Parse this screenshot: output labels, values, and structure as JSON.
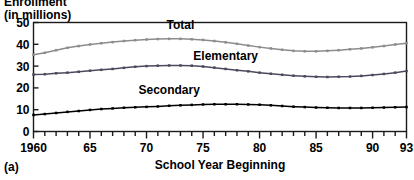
{
  "figure": {
    "panel_tag": "(a)",
    "y_axis_label_line1": "Enrollment",
    "y_axis_label_line2": "(in millions)",
    "x_axis_title": "School Year Beginning"
  },
  "chart_data": {
    "type": "line",
    "title": "",
    "subtitle": "",
    "xlabel": "School Year Beginning",
    "ylabel": "Enrollment (in millions)",
    "xlim": [
      1960,
      1993
    ],
    "ylim": [
      0,
      50
    ],
    "grid": false,
    "legend_position": "inline-labels",
    "y_ticks": [
      0,
      10,
      20,
      30,
      40,
      50
    ],
    "y_tick_labels": [
      "0",
      "10",
      "20",
      "30",
      "40",
      "50"
    ],
    "x_ticks": [
      1960,
      1965,
      1970,
      1975,
      1980,
      1985,
      1990,
      1993
    ],
    "x_tick_labels": [
      "1960",
      "65",
      "70",
      "75",
      "80",
      "85",
      "90",
      "93"
    ],
    "x_minor_tick_interval": 1,
    "markers": "small-square",
    "x": [
      1960,
      1961,
      1962,
      1963,
      1964,
      1965,
      1966,
      1967,
      1968,
      1969,
      1970,
      1971,
      1972,
      1973,
      1974,
      1975,
      1976,
      1977,
      1978,
      1979,
      1980,
      1981,
      1982,
      1983,
      1984,
      1985,
      1986,
      1987,
      1988,
      1989,
      1990,
      1991,
      1992,
      1993
    ],
    "series": [
      {
        "name": "Total",
        "color": "#8c8c8c",
        "label_x": 1973,
        "label_y": 47,
        "values": [
          35.2,
          36.1,
          37.3,
          38.4,
          39.2,
          39.9,
          40.5,
          41.0,
          41.5,
          41.9,
          42.2,
          42.4,
          42.5,
          42.5,
          42.3,
          42.0,
          41.5,
          40.9,
          40.2,
          39.4,
          38.7,
          38.1,
          37.5,
          37.0,
          36.8,
          36.8,
          37.0,
          37.3,
          37.7,
          38.1,
          38.6,
          39.2,
          39.9,
          40.5
        ]
      },
      {
        "name": "Elementary",
        "color": "#4a4a5e",
        "label_x": 1977,
        "label_y": 33,
        "values": [
          26.1,
          26.3,
          26.7,
          27.0,
          27.4,
          27.9,
          28.3,
          28.7,
          29.2,
          29.7,
          30.0,
          30.2,
          30.3,
          30.3,
          30.2,
          29.8,
          29.3,
          28.7,
          28.1,
          27.6,
          27.0,
          26.5,
          26.0,
          25.6,
          25.3,
          25.1,
          25.0,
          25.1,
          25.2,
          25.5,
          25.9,
          26.4,
          27.0,
          27.7
        ]
      },
      {
        "name": "Secondary",
        "color": "#000000",
        "label_x": 1972,
        "label_y": 17,
        "values": [
          7.6,
          8.0,
          8.5,
          9.0,
          9.4,
          9.9,
          10.3,
          10.6,
          10.9,
          11.1,
          11.3,
          11.5,
          11.8,
          12.0,
          12.2,
          12.4,
          12.5,
          12.5,
          12.5,
          12.4,
          12.3,
          12.0,
          11.7,
          11.4,
          11.2,
          11.0,
          10.9,
          10.8,
          10.8,
          10.8,
          10.9,
          11.0,
          11.1,
          11.2
        ]
      }
    ]
  }
}
